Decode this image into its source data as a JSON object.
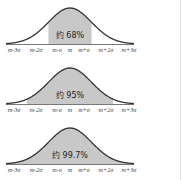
{
  "colors": {
    "curve": "#333333",
    "shade": "#c8c8c8",
    "axis": "#555555",
    "label": "#444444",
    "background": "#ffffff"
  },
  "tick_labels": [
    "m-3σ",
    "m-2σ",
    "m-σ",
    "m",
    "m+σ",
    "m+2σ",
    "m+3σ"
  ],
  "panels": [
    {
      "label": "约 68%",
      "range_sigma": 1
    },
    {
      "label": "约 95%",
      "range_sigma": 2
    },
    {
      "label": "约 99.7%",
      "range_sigma": 3
    }
  ],
  "chart_data": [
    {
      "type": "area",
      "title": "",
      "annotation": "约 68%",
      "x": [
        "m-3σ",
        "m-2σ",
        "m-σ",
        "m",
        "m+σ",
        "m+2σ",
        "m+3σ"
      ],
      "shaded_interval": [
        "m-σ",
        "m+σ"
      ],
      "shaded_probability": 0.68
    },
    {
      "type": "area",
      "title": "",
      "annotation": "约 95%",
      "x": [
        "m-3σ",
        "m-2σ",
        "m-σ",
        "m",
        "m+σ",
        "m+2σ",
        "m+3σ"
      ],
      "shaded_interval": [
        "m-2σ",
        "m+2σ"
      ],
      "shaded_probability": 0.95
    },
    {
      "type": "area",
      "title": "",
      "annotation": "约 99.7%",
      "x": [
        "m-3σ",
        "m-2σ",
        "m-σ",
        "m",
        "m+σ",
        "m+2σ",
        "m+3σ"
      ],
      "shaded_interval": [
        "m-3σ",
        "m+3σ"
      ],
      "shaded_probability": 0.997
    }
  ]
}
